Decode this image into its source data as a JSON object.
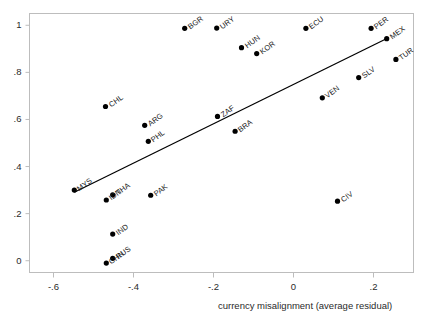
{
  "chart_data": {
    "type": "scatter",
    "title": "",
    "xlabel": "currency misalignment (average residual)",
    "ylabel": "",
    "xlim": [
      -0.66,
      0.3
    ],
    "ylim": [
      -0.05,
      1.05
    ],
    "grid": false,
    "legend": "none",
    "xticks": [
      -0.6,
      -0.4,
      -0.2,
      0,
      0.2
    ],
    "xticklabels": [
      "-.6",
      "-.4",
      "-.2",
      "0",
      ".2"
    ],
    "yticks": [
      0,
      0.2,
      0.4,
      0.6,
      0.8,
      1
    ],
    "yticklabels": [
      "0",
      ".2",
      ".4",
      ".6",
      ".8",
      "1"
    ],
    "points": [
      {
        "label": "MYS",
        "x": -0.548,
        "y": 0.3
      },
      {
        "label": "CHL",
        "x": -0.47,
        "y": 0.655
      },
      {
        "label": "IDN",
        "x": -0.468,
        "y": 0.258
      },
      {
        "label": "THA",
        "x": -0.452,
        "y": 0.28
      },
      {
        "label": "IND",
        "x": -0.452,
        "y": 0.113
      },
      {
        "label": "CHN",
        "x": -0.468,
        "y": -0.01
      },
      {
        "label": "RUS",
        "x": -0.452,
        "y": 0.01
      },
      {
        "label": "ARG",
        "x": -0.372,
        "y": 0.575
      },
      {
        "label": "PHL",
        "x": -0.363,
        "y": 0.507
      },
      {
        "label": "PAK",
        "x": -0.357,
        "y": 0.278
      },
      {
        "label": "BGR",
        "x": -0.272,
        "y": 0.987
      },
      {
        "label": "URY",
        "x": -0.192,
        "y": 0.988
      },
      {
        "label": "ZAF",
        "x": -0.19,
        "y": 0.613
      },
      {
        "label": "BRA",
        "x": -0.146,
        "y": 0.55
      },
      {
        "label": "HUN",
        "x": -0.13,
        "y": 0.905
      },
      {
        "label": "KOR",
        "x": -0.092,
        "y": 0.88
      },
      {
        "label": "ECU",
        "x": 0.031,
        "y": 0.987
      },
      {
        "label": "VEN",
        "x": 0.072,
        "y": 0.692
      },
      {
        "label": "CIV",
        "x": 0.11,
        "y": 0.253
      },
      {
        "label": "SLV",
        "x": 0.163,
        "y": 0.778
      },
      {
        "label": "PER",
        "x": 0.194,
        "y": 0.987
      },
      {
        "label": "MEX",
        "x": 0.233,
        "y": 0.943
      },
      {
        "label": "TUR",
        "x": 0.256,
        "y": 0.855
      }
    ],
    "trendline": {
      "x0": -0.548,
      "y0": 0.291,
      "x1": 0.236,
      "y1": 0.946
    },
    "marker_color": "#000000",
    "line_color": "#000000",
    "axis_color": "#b9b9b9",
    "text_color": "#1a1a1a"
  }
}
